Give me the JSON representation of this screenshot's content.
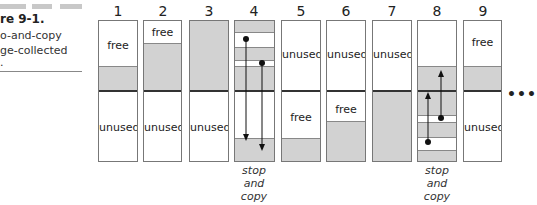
{
  "caption": {
    "title_partial": "re 9-1.",
    "line1_partial": "o-and-copy",
    "line2_partial": "ge-collected",
    "line3_partial": "."
  },
  "columns": [
    {
      "number": "1",
      "top_label": "free",
      "bottom_label": "unused"
    },
    {
      "number": "2",
      "top_label": "free",
      "bottom_label": "unused"
    },
    {
      "number": "3",
      "top_label": "",
      "bottom_label": "unused"
    },
    {
      "number": "4",
      "top_label": "",
      "bottom_label": "",
      "note": [
        "stop",
        "and",
        "copy"
      ]
    },
    {
      "number": "5",
      "top_label": "unused",
      "bottom_label": "free"
    },
    {
      "number": "6",
      "top_label": "unused",
      "bottom_label": "free"
    },
    {
      "number": "7",
      "top_label": "unused",
      "bottom_label": ""
    },
    {
      "number": "8",
      "top_label": "",
      "bottom_label": "",
      "note": [
        "stop",
        "and",
        "copy"
      ]
    },
    {
      "number": "9",
      "top_label": "free",
      "bottom_label": "unused"
    }
  ],
  "continuation": "•••",
  "colors": {
    "used_fill": "#d2d2d2",
    "free_fill": "#ffffff",
    "border": "#777777",
    "divider": "#333333"
  }
}
